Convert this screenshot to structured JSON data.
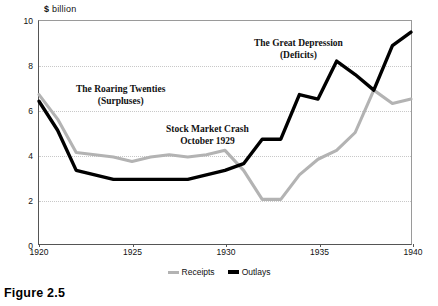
{
  "figure": {
    "caption": "Figure 2.5"
  },
  "chart_data": {
    "type": "line",
    "title": "",
    "subtitle": "",
    "xlabel": "",
    "ylabel": "$ billion",
    "ylabel_currency": "$",
    "ylabel_unit": "billion",
    "xlim": [
      1920,
      1940
    ],
    "ylim": [
      0,
      10
    ],
    "grid": true,
    "gridlines_y": [
      2,
      4,
      6,
      8,
      10
    ],
    "yticks": [
      0,
      2,
      4,
      6,
      8,
      10
    ],
    "ytick_labels": [
      "0",
      "2",
      "4",
      "6",
      "8",
      "10"
    ],
    "xticks": [
      1920,
      1925,
      1930,
      1935,
      1940
    ],
    "xtick_labels": [
      "1920",
      "1925",
      "1930",
      "1935",
      "1940"
    ],
    "legend_position": "bottom-center",
    "x": [
      1920,
      1921,
      1922,
      1923,
      1924,
      1925,
      1926,
      1927,
      1928,
      1929,
      1930,
      1931,
      1932,
      1933,
      1934,
      1935,
      1936,
      1937,
      1938,
      1939,
      1940
    ],
    "series": [
      {
        "name": "Receipts",
        "color": "#b3b3b3",
        "values": [
          6.7,
          5.6,
          4.1,
          4.0,
          3.9,
          3.7,
          3.9,
          4.0,
          3.9,
          4.0,
          4.2,
          3.3,
          2.0,
          2.0,
          3.1,
          3.8,
          4.2,
          5.0,
          6.9,
          6.3,
          6.5
        ]
      },
      {
        "name": "Outlays",
        "color": "#000000",
        "values": [
          6.4,
          5.1,
          3.3,
          3.1,
          2.9,
          2.9,
          2.9,
          2.9,
          2.9,
          3.1,
          3.3,
          3.6,
          4.7,
          4.7,
          6.7,
          6.5,
          8.2,
          7.6,
          6.9,
          8.9,
          9.5
        ]
      }
    ],
    "annotations": [
      {
        "id": "roaring-twenties",
        "line1": "The Roaring Twenties",
        "line2": "(Surpluses)"
      },
      {
        "id": "stock-market-crash",
        "line1": "Stock Market Crash",
        "line2": "October 1929"
      },
      {
        "id": "great-depression",
        "line1": "The Great Depression",
        "line2": "(Deficits)"
      }
    ]
  }
}
